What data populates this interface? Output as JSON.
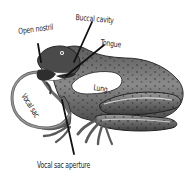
{
  "diagram": {
    "labels": {
      "open_nostril": "Open nostril",
      "buccal_cavity": "Buccal cavity",
      "tongue": "Tongue",
      "lung": "Lung",
      "vocal_sac": "Vocal sac",
      "vocal_sac_aperture": "Vocal sac aperture"
    },
    "colors": {
      "background": "#ffffff",
      "body_dark": "#3a3a3a",
      "body_mid": "#7a7a7a",
      "body_light": "#b8b8b8",
      "cavity_fill": "#ffffff",
      "leader_line": "#111111",
      "label_text": "#1a1a1a"
    }
  }
}
